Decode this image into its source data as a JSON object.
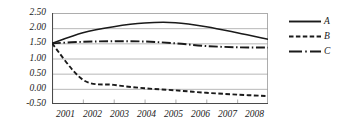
{
  "chart_data": {
    "type": "line",
    "title": "",
    "xlabel": "",
    "ylabel": "",
    "categories": [
      "2001",
      "2002",
      "2003",
      "2004",
      "2005",
      "2006",
      "2007",
      "2008"
    ],
    "x": [
      2001,
      2002,
      2003,
      2004,
      2005,
      2006,
      2007,
      2008
    ],
    "ylim": [
      -0.5,
      2.5
    ],
    "yticks": [
      "2.50",
      "2.00",
      "1.50",
      "1.00",
      "0.50",
      "0.00",
      "-0.50"
    ],
    "ytick_values": [
      2.5,
      2.0,
      1.5,
      1.0,
      0.5,
      0.0,
      -0.5
    ],
    "grid": true,
    "grid_axis": "y",
    "legend_position": "right",
    "series": [
      {
        "name": "A",
        "style": "solid",
        "color": "#1a1a1a",
        "values": [
          1.5,
          1.85,
          2.05,
          2.17,
          2.18,
          2.05,
          1.85,
          1.63
        ]
      },
      {
        "name": "B",
        "style": "dashed",
        "color": "#1a1a1a",
        "values": [
          1.5,
          0.3,
          0.13,
          0.02,
          -0.05,
          -0.13,
          -0.19,
          -0.24
        ]
      },
      {
        "name": "C",
        "style": "dashdot",
        "color": "#1a1a1a",
        "values": [
          1.5,
          1.55,
          1.57,
          1.56,
          1.5,
          1.41,
          1.37,
          1.36
        ]
      }
    ]
  },
  "legend": {
    "entries": [
      {
        "label": "A"
      },
      {
        "label": "B"
      },
      {
        "label": "C"
      }
    ]
  }
}
